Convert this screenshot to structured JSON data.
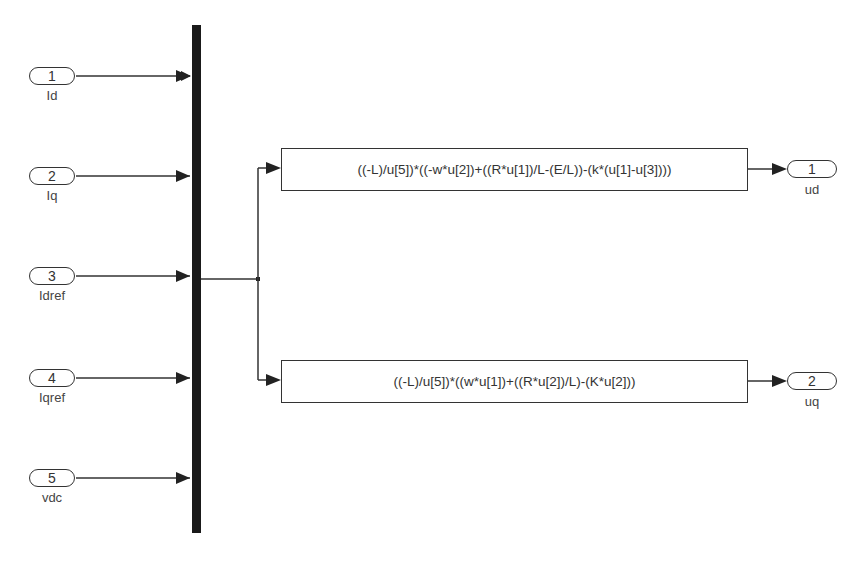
{
  "diagram": {
    "type": "simulink-block-diagram",
    "inports": [
      {
        "number": "1",
        "name": "Id"
      },
      {
        "number": "2",
        "name": "Iq"
      },
      {
        "number": "3",
        "name": "Idref"
      },
      {
        "number": "4",
        "name": "Iqref"
      },
      {
        "number": "5",
        "name": "vdc"
      }
    ],
    "mux": {
      "inputs": 5
    },
    "fcn_blocks": [
      {
        "expression": "((-L)/u[5])*((-w*u[2])+((R*u[1])/L-(E/L))-(k*(u[1]-u[3])))"
      },
      {
        "expression": "((-L)/u[5])*((w*u[1])+((R*u[2])/L)-(K*u[2]))"
      }
    ],
    "outports": [
      {
        "number": "1",
        "name": "ud"
      },
      {
        "number": "2",
        "name": "uq"
      }
    ],
    "colors": {
      "line": "#333333",
      "mux": "#1a1a1a",
      "background": "#ffffff"
    }
  }
}
